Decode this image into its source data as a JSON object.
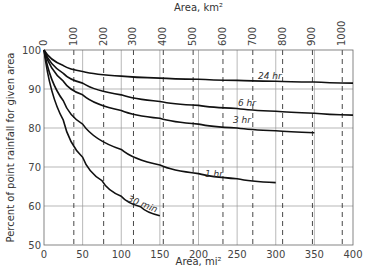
{
  "chart_data": {
    "type": "line",
    "title": "",
    "xlabel": "Area, mi²",
    "x2label": "Area, km²",
    "ylabel": "Percent of point rainfall for given area",
    "xlim": [
      0,
      400
    ],
    "ylim": [
      50,
      100
    ],
    "x_ticks": [
      0,
      50,
      100,
      150,
      200,
      250,
      300,
      350,
      400
    ],
    "y_ticks": [
      50,
      60,
      70,
      80,
      90,
      100
    ],
    "x2_ticks": [
      0,
      100,
      200,
      300,
      400,
      500,
      600,
      700,
      800,
      900,
      1000
    ],
    "grid": true,
    "series": [
      {
        "name": "24 hr",
        "x": [
          0,
          25,
          50,
          100,
          150,
          200,
          250,
          300,
          350,
          400
        ],
        "values": [
          100,
          96,
          94.5,
          93.3,
          92.8,
          92.5,
          92.2,
          92,
          91.8,
          91.5
        ]
      },
      {
        "name": "6 hr",
        "x": [
          0,
          25,
          50,
          100,
          150,
          200,
          250,
          300,
          350,
          400
        ],
        "values": [
          100,
          94,
          91.5,
          88.5,
          86.8,
          85.8,
          85,
          84.3,
          83.8,
          83.3
        ]
      },
      {
        "name": "3 hr",
        "x": [
          0,
          25,
          50,
          100,
          150,
          200,
          250,
          300,
          350
        ],
        "values": [
          100,
          92,
          88.5,
          84.5,
          82.5,
          81,
          80,
          79.3,
          78.8
        ]
      },
      {
        "name": "1 hr",
        "x": [
          0,
          25,
          50,
          100,
          150,
          200,
          250,
          300
        ],
        "values": [
          100,
          87,
          81,
          74.5,
          70.5,
          68.3,
          67,
          66
        ]
      },
      {
        "name": "30 min",
        "x": [
          0,
          25,
          50,
          75,
          100,
          125,
          150
        ],
        "values": [
          100,
          82,
          72.5,
          66.5,
          62.5,
          59.8,
          57.5
        ]
      }
    ],
    "legend": "inline labels on curves"
  }
}
